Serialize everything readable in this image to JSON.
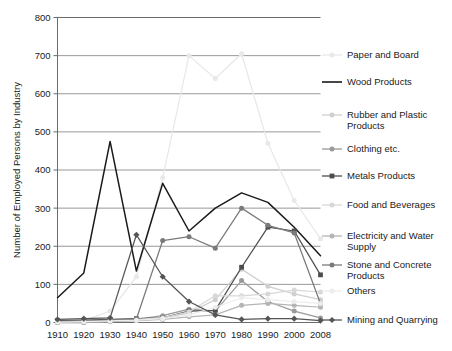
{
  "chart_data": {
    "type": "line",
    "title": "",
    "xlabel": "",
    "ylabel": "Number of Employed Persons by Industry",
    "x": [
      1910,
      1920,
      1930,
      1940,
      1950,
      1960,
      1970,
      1980,
      1990,
      2000,
      2008
    ],
    "xticklabels": [
      "1910",
      "1920",
      "1930",
      "1940",
      "1950",
      "1960",
      "1970",
      "1980",
      "1990",
      "2000",
      "2008"
    ],
    "yticklabels": [
      "0",
      "100",
      "200",
      "300",
      "400",
      "500",
      "600",
      "700",
      "800"
    ],
    "yticks": [
      0,
      100,
      200,
      300,
      400,
      500,
      600,
      700,
      800
    ],
    "ylim": [
      0,
      800
    ],
    "grid": "horizontal",
    "legend_position": "right",
    "series": [
      {
        "name": "Paper and Board",
        "color": "#e8e8e8",
        "marker": "dot",
        "values": [
          0,
          5,
          30,
          120,
          380,
          700,
          640,
          705,
          470,
          320,
          220
        ]
      },
      {
        "name": "Wood Products",
        "color": "#1a1a1a",
        "marker": "none",
        "values": [
          65,
          130,
          475,
          135,
          365,
          240,
          300,
          340,
          315,
          250,
          175
        ]
      },
      {
        "name": "Rubber and Plastic Products",
        "color": "#cfcfcf",
        "marker": "dot",
        "values": [
          0,
          0,
          2,
          5,
          10,
          25,
          60,
          140,
          95,
          75,
          60
        ]
      },
      {
        "name": "Clothing etc.",
        "color": "#9a9a9a",
        "marker": "dot",
        "values": [
          0,
          0,
          3,
          8,
          18,
          35,
          30,
          110,
          55,
          30,
          12
        ]
      },
      {
        "name": "Metals Products",
        "color": "#4d4d4d",
        "marker": "square",
        "values": [
          5,
          6,
          8,
          10,
          12,
          30,
          32,
          145,
          250,
          240,
          125
        ]
      },
      {
        "name": "Food and Beverages",
        "color": "#d8d8d8",
        "marker": "dot",
        "values": [
          2,
          3,
          5,
          8,
          12,
          28,
          70,
          70,
          75,
          85,
          80
        ]
      },
      {
        "name": "Electricity and Water Supply",
        "color": "#b5b5b5",
        "marker": "dot",
        "values": [
          1,
          2,
          3,
          5,
          8,
          15,
          20,
          45,
          50,
          45,
          40
        ]
      },
      {
        "name": "Stone and Concrete Products",
        "color": "#7a7a7a",
        "marker": "dot",
        "values": [
          3,
          4,
          6,
          9,
          215,
          225,
          195,
          300,
          255,
          235,
          50
        ]
      },
      {
        "name": "Others",
        "color": "#ededed",
        "marker": "dot",
        "values": [
          1,
          2,
          4,
          6,
          10,
          20,
          40,
          65,
          60,
          55,
          50
        ]
      },
      {
        "name": "Mining and Quarrying",
        "color": "#555555",
        "marker": "diamond",
        "values": [
          8,
          10,
          12,
          230,
          120,
          55,
          20,
          8,
          10,
          10,
          5
        ]
      }
    ]
  },
  "legend": {
    "items": [
      {
        "label": "Paper and Board"
      },
      {
        "label": "Wood Products"
      },
      {
        "label": "Rubber and Plastic Products"
      },
      {
        "label": "Clothing etc."
      },
      {
        "label": "Metals Products"
      },
      {
        "label": "Food and Beverages"
      },
      {
        "label": "Electricity and Water Supply"
      },
      {
        "label": "Stone and Concrete Products"
      },
      {
        "label": "Others"
      },
      {
        "label": "Mining and Quarrying"
      }
    ]
  }
}
